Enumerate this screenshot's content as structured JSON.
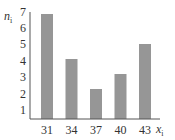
{
  "chart_data": {
    "type": "bar",
    "title": "",
    "xlabel": "x_i",
    "ylabel": "n_i",
    "categories": [
      "31",
      "34",
      "37",
      "40",
      "43"
    ],
    "values": [
      7,
      4,
      2,
      3,
      5
    ],
    "y_ticks": [
      "1",
      "2",
      "3",
      "4",
      "5",
      "6",
      "7"
    ],
    "ylim": [
      0,
      7
    ],
    "grid": false,
    "legend": null,
    "bar_color": "#969696"
  },
  "labels": {
    "y_main": "n",
    "y_sub": "i",
    "x_main": "x",
    "x_sub": "i"
  }
}
